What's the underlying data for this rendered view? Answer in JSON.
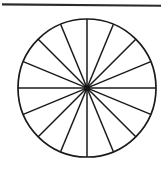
{
  "figure": {
    "background_color": "#ffffff",
    "width": 165,
    "height": 176
  },
  "top_rule": {
    "name": "horizontal-rule",
    "color": "#2b2b2b",
    "x1": 2,
    "y1": 4,
    "x2": 161,
    "y2": 6,
    "thickness": 2.1
  },
  "chart_data": {
    "type": "pie",
    "subtitle": "",
    "xlabel": "",
    "ylabel": "",
    "slice_count": 16,
    "slice_angle_degrees": 22.5,
    "categories": [
      "1",
      "2",
      "3",
      "4",
      "5",
      "6",
      "7",
      "8",
      "9",
      "10",
      "11",
      "12",
      "13",
      "14",
      "15",
      "16"
    ],
    "values": [
      6.25,
      6.25,
      6.25,
      6.25,
      6.25,
      6.25,
      6.25,
      6.25,
      6.25,
      6.25,
      6.25,
      6.25,
      6.25,
      6.25,
      6.25,
      6.25
    ],
    "value_unit": "percent",
    "labels_visible": false,
    "legend": false,
    "legend_position": "none",
    "grid": false,
    "fill_color": "#ffffff",
    "stroke_color": "#1a1a1a",
    "center_x": 87,
    "center_y": 88,
    "radius": 69,
    "spoke_start_angle_degrees": 90,
    "annotations": []
  }
}
